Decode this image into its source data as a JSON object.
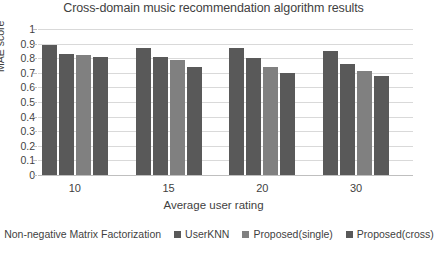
{
  "chart_data": {
    "type": "bar",
    "title": "Cross-domain music recommendation algorithm results",
    "xlabel": "Average user rating",
    "ylabel": "MAE score",
    "categories": [
      "10",
      "15",
      "20",
      "30"
    ],
    "ylim": [
      0,
      1
    ],
    "yticks": [
      "0",
      "0.1",
      "0.2",
      "0.3",
      "0.4",
      "0.5",
      "0.6",
      "0.7",
      "0.8",
      "0.9",
      "1"
    ],
    "ytick_values": [
      0,
      0.1,
      0.2,
      0.3,
      0.4,
      0.5,
      0.6,
      0.7,
      0.8,
      0.9,
      1
    ],
    "grid": true,
    "legend_position": "bottom",
    "series": [
      {
        "name": "Non-negative Matrix Factorization",
        "color": "#595959",
        "values": [
          0.89,
          0.87,
          0.87,
          0.85
        ]
      },
      {
        "name": "UserKNN",
        "color": "#595959",
        "values": [
          0.83,
          0.81,
          0.8,
          0.76
        ]
      },
      {
        "name": "Proposed(single)",
        "color": "#808080",
        "values": [
          0.82,
          0.79,
          0.74,
          0.71
        ]
      },
      {
        "name": "Proposed(cross)",
        "color": "#595959",
        "values": [
          0.81,
          0.74,
          0.7,
          0.68
        ]
      }
    ]
  }
}
